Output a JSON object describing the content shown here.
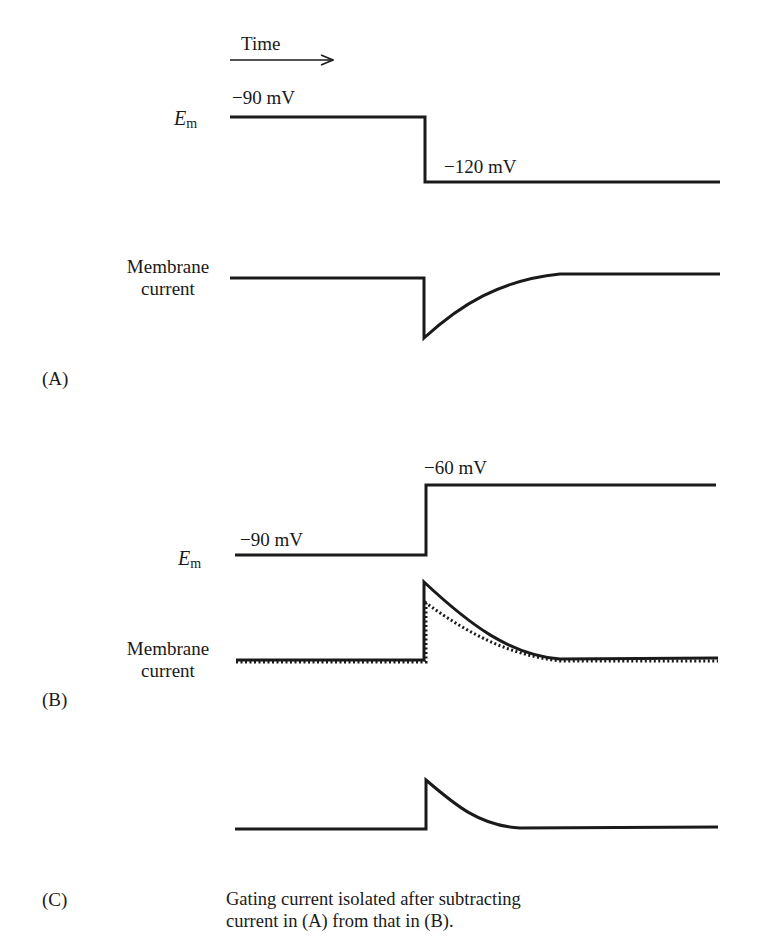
{
  "time_axis": {
    "label": "Time"
  },
  "panel_a": {
    "letter": "(A)",
    "em_label": "E",
    "em_sub": "m",
    "holding_voltage": "−90 mV",
    "step_voltage": "−120 mV",
    "current_label_line1": "Membrane",
    "current_label_line2": "current"
  },
  "panel_b": {
    "letter": "(B)",
    "em_label": "E",
    "em_sub": "m",
    "holding_voltage": "−90 mV",
    "step_voltage": "−60 mV",
    "current_label_line1": "Membrane",
    "current_label_line2": "current"
  },
  "panel_c": {
    "letter": "(C)",
    "caption_line1": "Gating current isolated after subtracting",
    "caption_line2": "current in (A) from that in (B)."
  },
  "colors": {
    "trace": "#1a1a1a",
    "background": "#ffffff"
  }
}
